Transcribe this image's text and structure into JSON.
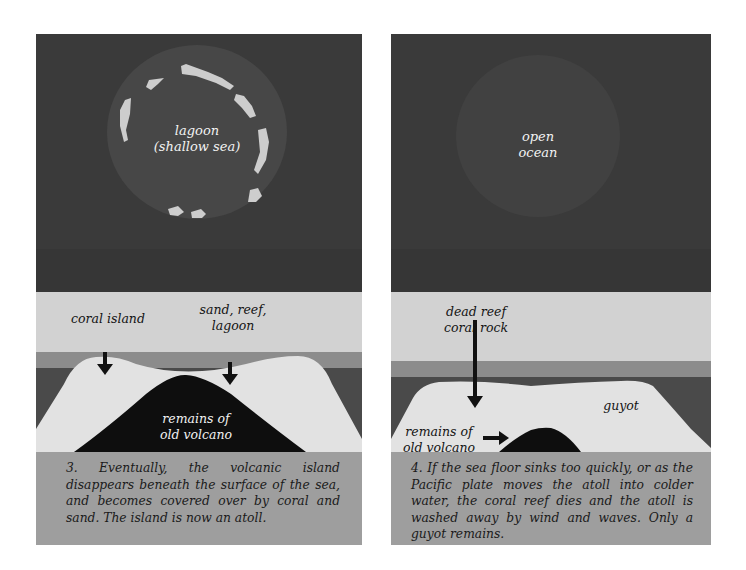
{
  "panels": [
    {
      "id": "panel-3",
      "aerial_labels": {
        "line1": "lagoon",
        "line2": "(shallow sea)"
      },
      "cross_section_labels": {
        "coral_island": "coral island",
        "sand_reef_line1": "sand, reef,",
        "sand_reef_line2": "lagoon",
        "volcano_line1": "remains of",
        "volcano_line2": "old volcano"
      },
      "caption": "3. Eventually, the volcanic island disappears beneath the surface of the sea, and becomes covered over by coral and sand. The island is now an atoll."
    },
    {
      "id": "panel-4",
      "aerial_labels": {
        "line1": "open",
        "line2": "ocean"
      },
      "cross_section_labels": {
        "dead_reef_line1": "dead reef",
        "dead_reef_line2": "coral rock",
        "guyot": "guyot",
        "volcano_line1": "remains of",
        "volcano_line2": "old volcano"
      },
      "caption": "4. If the sea floor sinks too quickly, or as the Pacific plate moves the atoll into colder water, the coral reef dies and the atoll is washed away by wind and waves. Only a guyot remains."
    }
  ],
  "colors": {
    "deep_sea": "#3a3a3a",
    "lagoon": "#474747",
    "reef_islets": "#cfcfcf",
    "sky_band": "#d2d2d2",
    "surface_water": "#8c8c8c",
    "deep_water": "#4a4a4a",
    "coral_mound": "#e2e2e2",
    "volcano": "#0e0e0e",
    "caption_band": "#9e9e9e"
  }
}
